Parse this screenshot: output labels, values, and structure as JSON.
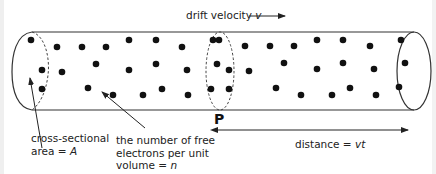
{
  "diagram": {
    "title_label": "drift velocity",
    "title_var": "v",
    "cross_section_label_line1": "cross-sectional",
    "cross_section_label_line2_prefix": "area = ",
    "cross_section_var": "A",
    "density_label_line1": "the number of free",
    "density_label_line2": "electrons per unit",
    "density_label_line3_prefix": "volume = ",
    "density_var": "n",
    "point_label": "P",
    "distance_label_prefix": "distance = ",
    "distance_var": "vt",
    "colors": {
      "line": "#333333",
      "dot": "#111111",
      "text": "#222222"
    }
  },
  "electrons": [
    [
      31,
      40
    ],
    [
      57,
      47
    ],
    [
      82,
      47
    ],
    [
      106,
      47
    ],
    [
      129,
      40
    ],
    [
      156,
      40
    ],
    [
      182,
      47
    ],
    [
      213,
      40
    ],
    [
      219,
      40
    ],
    [
      245,
      46
    ],
    [
      270,
      46
    ],
    [
      294,
      46
    ],
    [
      317,
      40
    ],
    [
      343,
      40
    ],
    [
      370,
      46
    ],
    [
      401,
      40
    ],
    [
      42,
      70
    ],
    [
      62,
      72
    ],
    [
      96,
      64
    ],
    [
      129,
      70
    ],
    [
      156,
      64
    ],
    [
      187,
      70
    ],
    [
      217,
      64
    ],
    [
      229,
      70
    ],
    [
      249,
      71
    ],
    [
      284,
      63
    ],
    [
      317,
      69
    ],
    [
      343,
      63
    ],
    [
      374,
      69
    ],
    [
      405,
      63
    ],
    [
      42,
      89
    ],
    [
      88,
      88
    ],
    [
      113,
      95
    ],
    [
      143,
      95
    ],
    [
      162,
      89
    ],
    [
      188,
      95
    ],
    [
      211,
      89
    ],
    [
      229,
      89
    ],
    [
      276,
      88
    ],
    [
      301,
      95
    ],
    [
      332,
      95
    ],
    [
      350,
      88
    ],
    [
      376,
      95
    ],
    [
      399,
      87
    ]
  ]
}
